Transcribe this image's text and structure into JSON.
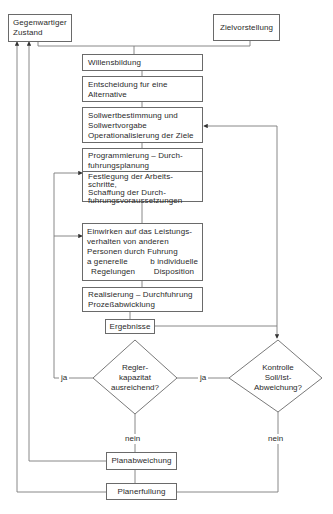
{
  "diagram": {
    "type": "flowchart",
    "language": "de",
    "nodes": {
      "current_state": {
        "lines": [
          "Gegenwartiger",
          "Zustand"
        ]
      },
      "target_vision": {
        "lines": [
          "Zielvorstellung"
        ]
      },
      "will_formation": {
        "lines": [
          "Willensbildung"
        ]
      },
      "decision": {
        "lines": [
          "Entscheidung fur eine",
          "Alternative"
        ]
      },
      "setpoint": {
        "lines": [
          "Sollwertbestimmung und",
          "Sollwertvorgabe",
          "Operationalisierung der Ziele"
        ]
      },
      "programming": {
        "header_lines": [
          "Programmierung – Durch-",
          "fuhrungsplanung"
        ],
        "body_lines": [
          "Festlegung der Arbeits-",
          "schritte,",
          "Schaffung der Durch-",
          "fuhrungsvoraussetzungen"
        ]
      },
      "influence": {
        "lines": [
          "Einwirken auf das Leistungs-",
          "verhalten von anderen",
          "Personen durch Fuhrung"
        ],
        "col_a": {
          "title": "a generelle",
          "sub": "Regelungen"
        },
        "col_b": {
          "title": "b individuelle",
          "sub": "Disposition"
        }
      },
      "realization": {
        "lines": [
          "Realisierung – Durchfuhrung",
          "Prozeßabwicklung"
        ]
      },
      "results": {
        "lines": [
          "Ergebnisse"
        ]
      },
      "controller_capacity": {
        "lines": [
          "Regler-",
          "kapazitat",
          "ausreichend?"
        ]
      },
      "control": {
        "lines": [
          "Kontrolle",
          "Soll/Ist-",
          "Abweichung?"
        ]
      },
      "plan_deviation": {
        "lines": [
          "Planabweichung"
        ]
      },
      "plan_fulfillment": {
        "lines": [
          "Planerfullung"
        ]
      }
    },
    "edge_labels": {
      "regler_yes": "ja",
      "control_yes": "ja",
      "regler_no": "nein",
      "control_no": "nein"
    }
  }
}
